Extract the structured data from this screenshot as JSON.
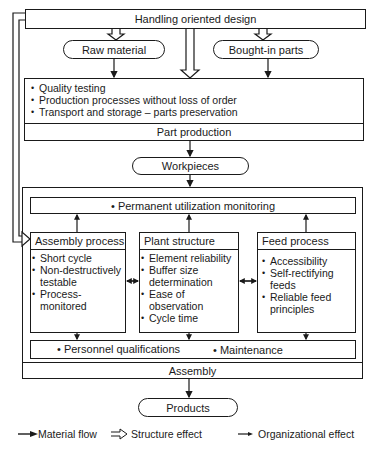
{
  "top": {
    "title": "Handling oriented design"
  },
  "inputs": {
    "raw_material": "Raw material",
    "bought_in_parts": "Bought-in parts"
  },
  "part_production": {
    "bullets": [
      "Quality testing",
      "Production processes without loss of order",
      "Transport and storage – parts preservation"
    ],
    "label": "Part production"
  },
  "workpieces": "Workpieces",
  "assembly": {
    "monitoring": "• Permanent utilization monitoring",
    "assembly_process": {
      "title": "Assembly process",
      "bullets": [
        "Short cycle",
        "Non-destructively testable",
        "Process-monitored"
      ]
    },
    "plant_structure": {
      "title": "Plant structure",
      "bullets": [
        "Element reliability",
        "Buffer size determination",
        "Ease of observation",
        "Cycle time"
      ]
    },
    "feed_process": {
      "title": "Feed process",
      "bullets": [
        "Accessibility",
        "Self-rectifying feeds",
        "Reliable feed principles"
      ]
    },
    "personnel": "• Personnel qualifications",
    "maintenance": "• Maintenance",
    "label": "Assembly"
  },
  "products": "Products",
  "legend": {
    "material_flow": "Material flow",
    "structure_effect": "Structure effect",
    "organizational_effect": "Organizational effect"
  }
}
